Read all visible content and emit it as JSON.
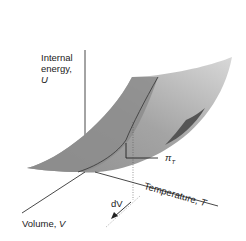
{
  "diagram": {
    "axes": {
      "u_label_line1": "Internal",
      "u_label_line2": "energy,",
      "u_symbol": "U",
      "t_label": "Temperature, ",
      "t_symbol": "T",
      "v_label": "Volume, ",
      "v_symbol": "V"
    },
    "annotations": {
      "pi_t": "π",
      "pi_t_sub": "T",
      "dv": "dV"
    },
    "colors": {
      "surface": "#9a9a9a",
      "surface_light": "#c4c4c4",
      "surface_dark": "#5a5a5a",
      "lines": "#333333"
    }
  }
}
